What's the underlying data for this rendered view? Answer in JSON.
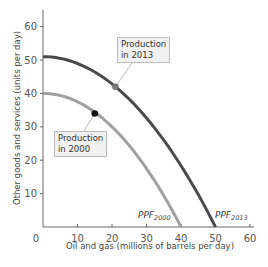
{
  "chart_data": {
    "type": "line",
    "title": "",
    "xlabel": "Oil and gas (millions of barrels per day)",
    "ylabel": "Other goods and services (units per day)",
    "xlim": [
      0,
      60
    ],
    "ylim": [
      0,
      65
    ],
    "xticks": [
      0,
      10,
      20,
      30,
      40,
      50,
      60
    ],
    "yticks": [
      10,
      20,
      30,
      40,
      50,
      60
    ],
    "grid": false,
    "series": [
      {
        "name": "PPF2000",
        "label_main": "PPF",
        "label_sub": "2000",
        "color": "#a0a0a0",
        "x": [
          0,
          10,
          20,
          30,
          35,
          40
        ],
        "y": [
          40,
          37.5,
          30,
          17.5,
          9.4,
          0
        ]
      },
      {
        "name": "PPF2013",
        "label_main": "PPF",
        "label_sub": "2013",
        "color": "#4a4a4a",
        "x": [
          0,
          10,
          20,
          30,
          40,
          50
        ],
        "y": [
          51,
          49,
          42.8,
          32.6,
          18.4,
          0
        ]
      }
    ],
    "points": [
      {
        "label": "Production in 2000",
        "x": 15,
        "y": 34,
        "color": "#111111"
      },
      {
        "label": "Production in 2013",
        "x": 21,
        "y": 42,
        "color": "#777777"
      }
    ],
    "annotations": [
      {
        "text_line1": "Production",
        "text_line2": "in 2013"
      },
      {
        "text_line1": "Production",
        "text_line2": "in 2000"
      }
    ]
  }
}
